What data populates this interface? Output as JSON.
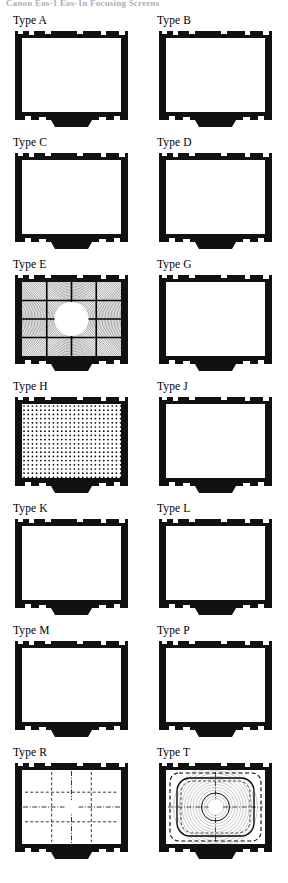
{
  "page": {
    "title": "Canon Eos-1 Eos-1n Focusing Screens",
    "background_color": "#ffffff",
    "ink_color": "#000000"
  },
  "legend": {
    "frame_color": "#111111",
    "field_color": "#ffffff",
    "ring_color": "#1a1a1a",
    "grid_color": "#000000"
  },
  "screens": [
    {
      "id": "type-a",
      "label": "Type A",
      "pattern": "fresnel-rings",
      "center": "split-circle",
      "description": "New Split / Microprism rings with horizontal split-image circle"
    },
    {
      "id": "type-b",
      "label": "Type B",
      "pattern": "fresnel-rings",
      "center": "plain-circle",
      "description": "Matte rings with plain central circle"
    },
    {
      "id": "type-c",
      "label": "Type C",
      "pattern": "plain",
      "center": "crosshair-circle",
      "description": "Clear field with cross-hair reticle circle"
    },
    {
      "id": "type-d",
      "label": "Type D",
      "pattern": "plain",
      "center": "none",
      "description": "Completely clear matte field"
    },
    {
      "id": "type-e",
      "label": "Type E",
      "pattern": "grid-rings",
      "center": "large-white-circle",
      "description": "Grid lines over rings with large clear centre circle"
    },
    {
      "id": "type-g",
      "label": "Type G",
      "pattern": "fresnel-rings",
      "center": "large-microprism-disc",
      "description": "Rings with large coarse microprism centre disc"
    },
    {
      "id": "type-h",
      "label": "Type H",
      "pattern": "full-matte-texture",
      "center": "none",
      "description": "Full-field cross-hatch ground matte"
    },
    {
      "id": "type-j",
      "label": "Type J",
      "pattern": "fresnel-rings",
      "center": "small-microprism-circle",
      "description": "Rings with small microprism spot inside circle"
    },
    {
      "id": "type-k",
      "label": "Type K",
      "pattern": "fresnel-rings",
      "center": "microprism-collar",
      "description": "Rings with microprism collar ring at centre"
    },
    {
      "id": "type-l",
      "label": "Type L",
      "pattern": "fresnel-rings",
      "center": "diagonal-split-circle",
      "description": "Rings with diagonal split-image circle"
    },
    {
      "id": "type-m",
      "label": "Type M",
      "pattern": "fresnel-rings",
      "center": "scale-crosshair",
      "description": "Rings with graduated cross scale and clear cross centre"
    },
    {
      "id": "type-p",
      "label": "Type P",
      "pattern": "fresnel-rings",
      "center": "donut-crosshair",
      "description": "Rings with full cross-hair and dark annulus centre"
    },
    {
      "id": "type-r",
      "label": "Type R",
      "pattern": "dashed-grid-rings",
      "center": "split-circle",
      "description": "Rings with dashed grid and horizontal split-image circle"
    },
    {
      "id": "type-t",
      "label": "Type T",
      "pattern": "tv-safe-frames",
      "center": "split-circle",
      "description": "TV safe-area dashed frames with split-image circle"
    }
  ]
}
